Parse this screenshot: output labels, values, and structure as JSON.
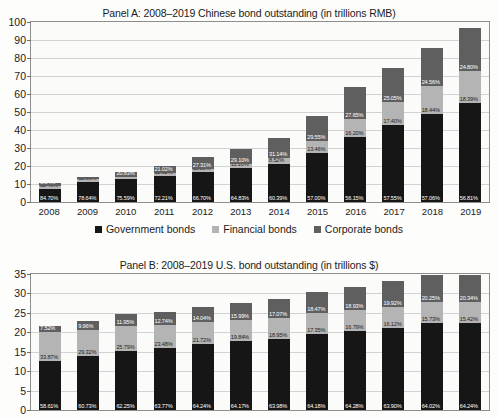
{
  "legend": {
    "items": [
      {
        "label": "Government bonds",
        "color": "#161616",
        "key": "government"
      },
      {
        "label": "Financial bonds",
        "color": "#b4b4b4",
        "key": "financial"
      },
      {
        "label": "Corporate bonds",
        "color": "#5f5f5f",
        "key": "corporate"
      }
    ]
  },
  "chart_data": [
    {
      "type": "bar",
      "stacked": true,
      "panel": "Panel A",
      "title": "Panel A: 2008–2019 Chinese bond outstanding (in trillions RMB)",
      "xlabel": "",
      "ylabel": "",
      "ylim": [
        0,
        100
      ],
      "yticks": [
        0,
        10,
        20,
        30,
        40,
        50,
        60,
        70,
        80,
        90,
        100
      ],
      "grid": true,
      "legend_position": "bottom",
      "categories": [
        "2008",
        "2009",
        "2010",
        "2011",
        "2012",
        "2013",
        "2014",
        "2015",
        "2016",
        "2017",
        "2018",
        "2019"
      ],
      "totals": [
        10.5,
        13.8,
        16.8,
        20.3,
        25.1,
        29.4,
        35.3,
        47.9,
        64.0,
        74.5,
        85.3,
        96.9
      ],
      "series": [
        {
          "name": "Government bonds",
          "color": "#161616",
          "values": [
            7.1,
            10.85,
            12.69,
            14.66,
            16.74,
            19.06,
            21.32,
            27.3,
            35.94,
            42.88,
            48.67,
            55.05
          ],
          "labels": [
            "84.70%",
            "78.64%",
            "75.59%",
            "72.21%",
            "66.70%",
            "64.83%",
            "60.39%",
            "57.00%",
            "56.15%",
            "57.55%",
            "57.06%",
            "56.81%"
          ]
        },
        {
          "name": "Financial bonds",
          "color": "#b4b4b4",
          "values": [
            1.58,
            1.78,
            1.32,
            1.7,
            1.5,
            1.79,
            3.0,
            6.45,
            10.37,
            12.96,
            15.73,
            17.82
          ],
          "labels": [
            "11.46%",
            "12.36%",
            "10.33%",
            "11.02%",
            "11.50%",
            "11.10%",
            "8.52%",
            "13.46%",
            "16.20%",
            "17.40%",
            "18.44%",
            "18.39%"
          ]
        },
        {
          "name": "Corporate bonds",
          "color": "#5f5f5f",
          "values": [
            1.82,
            1.17,
            2.79,
            3.94,
            6.86,
            8.55,
            10.98,
            14.15,
            17.69,
            18.66,
            20.9,
            24.03
          ],
          "labels": [
            "3.84%",
            "9.00%",
            "20.83%",
            "21.02%",
            "27.31%",
            "29.10%",
            "31.14%",
            "29.55%",
            "27.65%",
            "25.05%",
            "24.56%",
            "24.80%"
          ]
        }
      ]
    },
    {
      "type": "bar",
      "stacked": true,
      "panel": "Panel B",
      "title": "Panel B: 2008–2019 U.S. bond outstanding (in trillions $)",
      "xlabel": "",
      "ylabel": "",
      "ylim": [
        0,
        35
      ],
      "yticks": [
        0,
        5,
        10,
        15,
        20,
        25,
        30,
        35
      ],
      "grid": true,
      "legend_position": "bottom",
      "categories": [
        "2008",
        "2009",
        "2010",
        "2011",
        "2012",
        "2013",
        "2014",
        "2015",
        "2016",
        "2017",
        "2018",
        "2019"
      ],
      "totals": [
        21.6,
        22.8,
        24.6,
        25.2,
        26.5,
        27.6,
        28.6,
        30.5,
        31.6,
        33.2,
        34.7,
        34.8
      ],
      "series": [
        {
          "name": "Government bonds",
          "color": "#161616",
          "values": [
            12.66,
            13.85,
            15.31,
            16.07,
            17.02,
            17.71,
            18.3,
            19.57,
            20.31,
            21.22,
            22.28,
            22.36
          ],
          "labels": [
            "58.61%",
            "60.73%",
            "62.25%",
            "63.77%",
            "64.24%",
            "64.17%",
            "63.98%",
            "64.18%",
            "64.28%",
            "63.90%",
            "64.02%",
            "64.24%"
          ]
        },
        {
          "name": "Financial bonds",
          "color": "#b4b4b4",
          "values": [
            7.32,
            6.69,
            6.34,
            5.92,
            5.76,
            5.47,
            5.42,
            5.29,
            5.31,
            5.35,
            5.47,
            5.37
          ],
          "labels": [
            "33.87%",
            "29.32%",
            "25.79%",
            "23.48%",
            "21.72%",
            "19.84%",
            "18.95%",
            "17.35%",
            "16.79%",
            "16.12%",
            "15.73%",
            "15.42%"
          ]
        },
        {
          "name": "Corporate bonds",
          "color": "#5f5f5f",
          "values": [
            1.62,
            2.27,
            2.94,
            3.21,
            3.72,
            4.41,
            4.88,
            5.63,
            5.99,
            6.62,
            7.03,
            7.08
          ],
          "labels": [
            "7.52%",
            "9.96%",
            "11.95%",
            "12.74%",
            "14.04%",
            "15.99%",
            "17.07%",
            "18.47%",
            "18.93%",
            "19.92%",
            "20.25%",
            "20.34%"
          ]
        }
      ]
    }
  ]
}
